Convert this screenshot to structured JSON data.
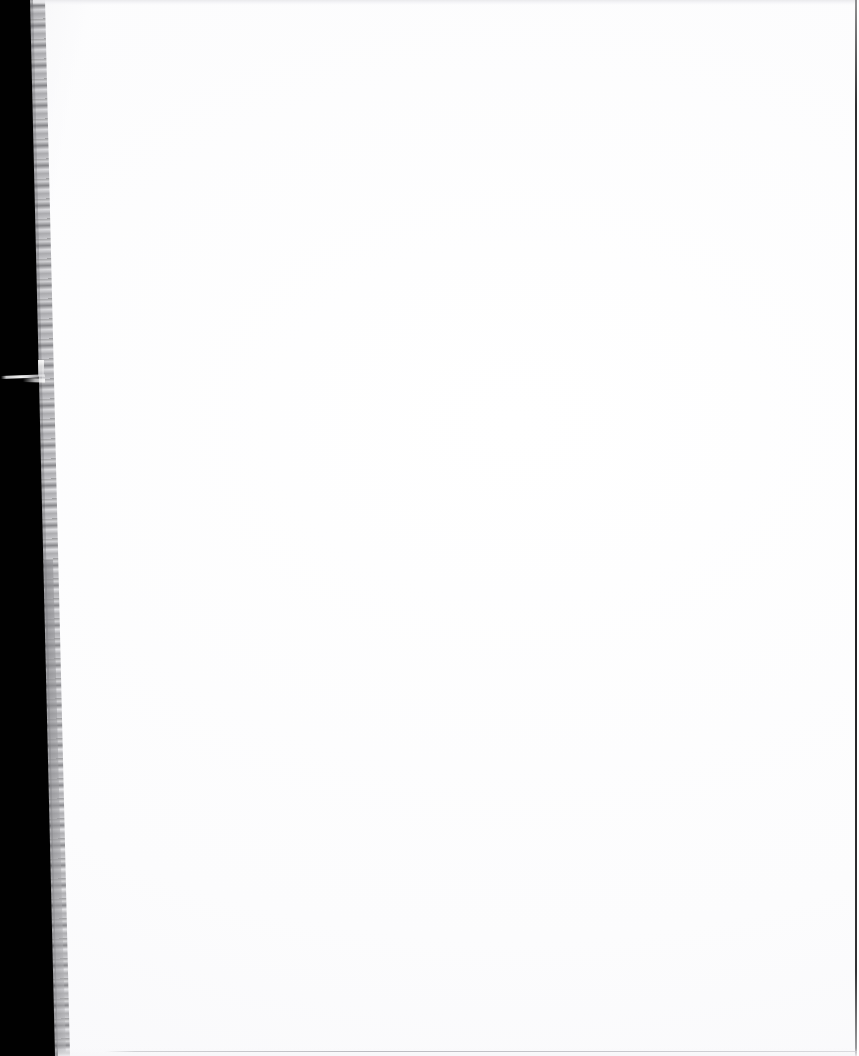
{
  "document": {
    "kind": "scanned-page-image",
    "page_content_text": "",
    "page_description": "Blank white scanned page with black scanner background along the left edge",
    "orientation": "portrait",
    "width_px": 859,
    "height_px": 1056
  },
  "page": {
    "background_color": "#fefefe",
    "scanner_background_color": "#010101",
    "has_visible_text": false,
    "has_visible_figures": false
  },
  "artifacts": {
    "left_scanner_void": {
      "label": "scanner background",
      "color": "#010101",
      "top_edge_x": 33,
      "bottom_edge_x": 58
    },
    "page_edge_shadow": {
      "label": "page edge shadow strip",
      "color": "#9a9a9e",
      "approx_width_px": 11
    },
    "white_streak": {
      "label": "scan streak artifact",
      "color": "#ffffff",
      "y_px": 377,
      "length_px": 44
    },
    "top_band": {
      "label": "top scan band",
      "color": "#e9e9ec",
      "height_px": 5
    },
    "right_edge_line": {
      "label": "right edge line",
      "color": "#18181a",
      "x_px": 855
    },
    "bottom_line": {
      "label": "bottom scan line",
      "color": "#b0b0b6",
      "y_px": 1051,
      "start_x_px": 105
    }
  }
}
